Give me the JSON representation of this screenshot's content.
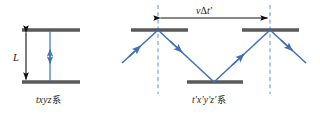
{
  "figure": {
    "title_hidden": "",
    "background_color": "#ffffff",
    "mirror_color": "#595959",
    "ray_color": "#3f6fb5",
    "dashed_color": "#6a9fd8",
    "dim_color": "#111111",
    "text_color": "#1a1a1a"
  },
  "left_panel": {
    "caption_italic": "txyz",
    "caption_cjk": "系",
    "length_label": "L",
    "mirrors": [
      {
        "name": "top-mirror",
        "x1": 22,
        "x2": 80,
        "y": 30
      },
      {
        "name": "bottom-mirror",
        "x1": 22,
        "x2": 80,
        "y": 82
      }
    ],
    "light_path": {
      "x": 50,
      "y_top": 30,
      "y_bottom": 82,
      "arrow_up_y": 50,
      "arrow_down_y": 62
    },
    "dimension": {
      "x": 25,
      "y_top": 30,
      "y_bottom": 82
    }
  },
  "right_panel": {
    "caption_italic": "t'x'y'z'",
    "caption_cjk": "系",
    "distance_label_v": "v",
    "distance_label_delta": "Δ",
    "distance_label_t": "t'",
    "distance_label_full": "vΔt'",
    "mirrors": [
      {
        "name": "top-mirror-left",
        "x1": 131,
        "x2": 188,
        "y": 30
      },
      {
        "name": "bottom-mirror-middle",
        "x1": 187,
        "x2": 243,
        "y": 82
      },
      {
        "name": "top-mirror-right",
        "x1": 242,
        "x2": 299,
        "y": 30
      }
    ],
    "dashed_lines": [
      {
        "name": "dashed-left",
        "x": 158,
        "y1": 5,
        "y2": 94
      },
      {
        "name": "dashed-right",
        "x": 270,
        "y1": 5,
        "y2": 94
      }
    ],
    "dimension_arrow": {
      "y": 18,
      "x_left": 158,
      "x_right": 270
    },
    "ray_segments": [
      {
        "name": "ray-incoming",
        "x1": 122,
        "y1": 63,
        "x2": 158,
        "y2": 30
      },
      {
        "name": "ray-down-to-bottom",
        "x1": 158,
        "y1": 30,
        "x2": 214,
        "y2": 82
      },
      {
        "name": "ray-up-to-right",
        "x1": 214,
        "y1": 82,
        "x2": 270,
        "y2": 30
      },
      {
        "name": "ray-outgoing",
        "x1": 270,
        "y1": 30,
        "x2": 306,
        "y2": 63
      }
    ]
  }
}
